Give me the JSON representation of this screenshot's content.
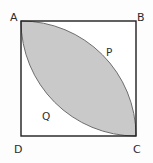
{
  "figure": {
    "background_color": "#fdfdfd",
    "square": {
      "stroke_color": "#1f1f1f",
      "stroke_width": 1.4,
      "fill_color": "#ffffff",
      "x": 21,
      "y": 21,
      "size": 115
    },
    "lens": {
      "fill_color": "#c9c9c9",
      "stroke_color": "#6e6e6e",
      "stroke_width": 1.0,
      "description": "Intersection of two quarter circles of radius equal to the side, centered at B and at D, meeting at A and C"
    },
    "vertices": [
      {
        "id": "A",
        "label": "A",
        "position": "top-left"
      },
      {
        "id": "B",
        "label": "B",
        "position": "top-right"
      },
      {
        "id": "C",
        "label": "C",
        "position": "bottom-right"
      },
      {
        "id": "D",
        "label": "D",
        "position": "bottom-left"
      }
    ],
    "regions": [
      {
        "id": "P",
        "label": "P",
        "position": "upper-right of lens"
      },
      {
        "id": "Q",
        "label": "Q",
        "position": "lower-left of lens"
      }
    ]
  }
}
